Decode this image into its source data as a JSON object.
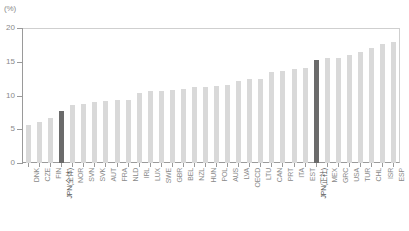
{
  "chart_data": {
    "type": "bar",
    "title": "",
    "xlabel": "",
    "ylabel": "",
    "unit_label": "(%)",
    "ylim": [
      0,
      20
    ],
    "yticks": [
      0,
      5,
      10,
      15,
      20
    ],
    "ytick_labels": [
      "0",
      "5",
      "10",
      "15",
      "20"
    ],
    "grid": false,
    "legend": "none",
    "bar_color": "#d9d9d9",
    "highlight_color": "#6b6b6b",
    "categories": [
      "DNK",
      "CZE",
      "FIN",
      "JPN(全体)",
      "NOR",
      "SVN",
      "SVK",
      "AUT",
      "FRA",
      "NLD",
      "IRL",
      "LUX",
      "SWE",
      "GBR",
      "BEL",
      "NZL",
      "HUN",
      "POL",
      "AUS",
      "LVA",
      "OECD",
      "LTU",
      "CAN",
      "PRT",
      "ITA",
      "EST",
      "JPN(正社)",
      "MEX",
      "GRC",
      "USA",
      "TUR",
      "CHL",
      "ISR",
      "ESP"
    ],
    "values": [
      5.7,
      6.1,
      6.7,
      7.7,
      8.6,
      8.8,
      9.0,
      9.2,
      9.3,
      9.4,
      10.3,
      10.6,
      10.7,
      10.8,
      11.0,
      11.2,
      11.3,
      11.4,
      11.5,
      12.2,
      12.4,
      12.5,
      13.5,
      13.6,
      14.0,
      14.1,
      15.2,
      15.6,
      15.6,
      16.0,
      16.4,
      17.0,
      17.6,
      17.9
    ],
    "highlighted": [
      "JPN(全体)",
      "JPN(正社)"
    ]
  }
}
